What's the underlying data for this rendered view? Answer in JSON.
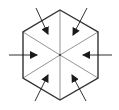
{
  "diagram": {
    "title": "",
    "colors": {
      "background": "#ffffff",
      "outline": "#333333",
      "inner_lines": "#777777",
      "arrow": "#1a1a1a"
    },
    "hexagon": {
      "center": [
        60,
        55
      ],
      "vertices": [
        [
          60,
          10
        ],
        [
          98,
          32
        ],
        [
          98,
          78
        ],
        [
          60,
          100
        ],
        [
          23,
          78
        ],
        [
          23,
          32
        ]
      ]
    },
    "arrows": [
      {
        "name": "arrow-upper-left",
        "from": [
          36,
          8
        ],
        "to": [
          48,
          34
        ]
      },
      {
        "name": "arrow-upper-right",
        "from": [
          87,
          8
        ],
        "to": [
          73,
          35
        ]
      },
      {
        "name": "arrow-left",
        "from": [
          9,
          55
        ],
        "to": [
          37,
          55
        ]
      },
      {
        "name": "arrow-right",
        "from": [
          112,
          55
        ],
        "to": [
          83,
          55
        ]
      },
      {
        "name": "arrow-lower-left",
        "from": [
          35,
          101
        ],
        "to": [
          48,
          75
        ]
      },
      {
        "name": "arrow-lower-right",
        "from": [
          86,
          101
        ],
        "to": [
          72,
          75
        ]
      }
    ]
  }
}
